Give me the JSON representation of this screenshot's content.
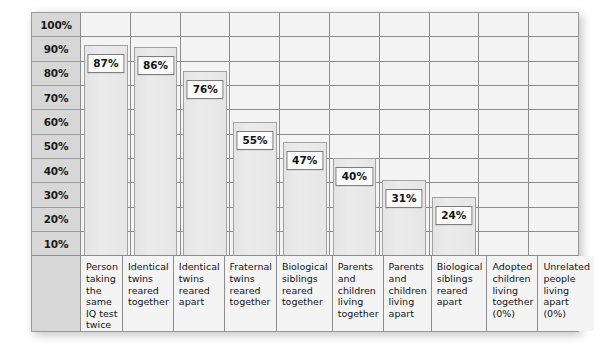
{
  "chart_data": {
    "type": "bar",
    "title": "",
    "subtitle": "",
    "xlabel": "",
    "ylabel": "",
    "ylim": [
      0,
      100
    ],
    "y_unit": "%",
    "grid": true,
    "legend": null,
    "y_ticks": [
      "100%",
      "90%",
      "80%",
      "70%",
      "60%",
      "50%",
      "40%",
      "30%",
      "20%",
      "10%"
    ],
    "categories": [
      "Person taking the same IQ test twice",
      "Identical twins reared together",
      "Identical twins reared apart",
      "Fraternal twins reared together",
      "Biological siblings reared together",
      "Parents and children living together",
      "Parents and children living apart",
      "Biological siblings reared apart",
      "Adopted children living together (0%)",
      "Unrelated people living apart (0%)"
    ],
    "values": [
      87,
      86,
      76,
      55,
      47,
      40,
      31,
      24,
      0,
      0
    ],
    "value_labels": [
      "87%",
      "86%",
      "76%",
      "55%",
      "47%",
      "40%",
      "31%",
      "24%",
      "",
      ""
    ],
    "bars": [
      {
        "label": "Person taking the same IQ test twice",
        "value": 87,
        "value_label": "87%"
      },
      {
        "label": "Identical twins reared together",
        "value": 86,
        "value_label": "86%"
      },
      {
        "label": "Identical twins reared apart",
        "value": 76,
        "value_label": "76%"
      },
      {
        "label": "Fraternal twins reared together",
        "value": 55,
        "value_label": "55%"
      },
      {
        "label": "Biological siblings reared together",
        "value": 47,
        "value_label": "47%"
      },
      {
        "label": "Parents and children living together",
        "value": 40,
        "value_label": "40%"
      },
      {
        "label": "Parents and children living apart",
        "value": 31,
        "value_label": "31%"
      },
      {
        "label": "Biological siblings reared apart",
        "value": 24,
        "value_label": "24%"
      },
      {
        "label": "Adopted children living together (0%)",
        "value": 0,
        "value_label": ""
      },
      {
        "label": "Unrelated people living apart (0%)",
        "value": 0,
        "value_label": ""
      }
    ]
  },
  "colors": {
    "panel_background": "#f4f4f4",
    "axis_column_background": "#d7d7d7",
    "gridline": "#8d8d8d",
    "bar_fill": "#e8e8e8",
    "bar_border": "#a2a2a2",
    "label_box_background": "#fbfbfb",
    "text": "#141414"
  }
}
